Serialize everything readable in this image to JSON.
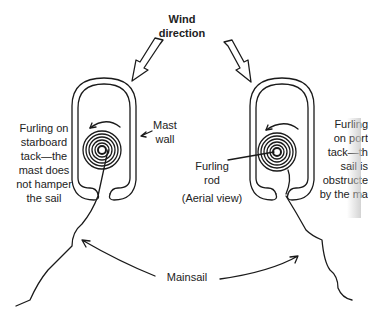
{
  "diagram": {
    "title": [
      "Wind",
      "direction"
    ],
    "left": {
      "caption": [
        "Furling on",
        "starboard",
        "tack—the",
        "mast does",
        "not hamper",
        "the sail"
      ],
      "mast_label": [
        "Mast",
        "wall"
      ]
    },
    "right": {
      "caption": [
        "Furling",
        "on port",
        "tack—th",
        "sail is",
        "obstructe",
        "by the ma"
      ],
      "rod_label": [
        "Furling",
        "rod"
      ],
      "view_label": "(Aerial view)"
    },
    "mainsail_label": "Mainsail",
    "line_color": "#1a1a1a"
  }
}
